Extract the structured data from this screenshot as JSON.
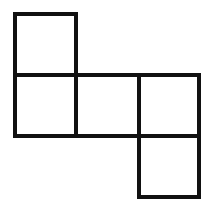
{
  "diagram": {
    "type": "cube-net",
    "line_color": "#111111",
    "background": "#ffffff",
    "squares": [
      {
        "id": "top-left",
        "x": 13,
        "y": 12,
        "w": 65,
        "h": 65
      },
      {
        "id": "middle-left",
        "x": 13,
        "y": 73,
        "w": 65,
        "h": 65
      },
      {
        "id": "middle-center",
        "x": 74,
        "y": 73,
        "w": 67,
        "h": 65
      },
      {
        "id": "middle-right",
        "x": 137,
        "y": 73,
        "w": 64,
        "h": 65
      },
      {
        "id": "bottom-right",
        "x": 137,
        "y": 134,
        "w": 64,
        "h": 65
      }
    ]
  }
}
